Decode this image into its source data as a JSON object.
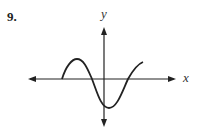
{
  "problem": {
    "number": "9."
  },
  "axes": {
    "x_label": "x",
    "y_label": "y"
  },
  "curve": {
    "description": "sinusoidal curve",
    "points": [
      [
        62,
        79
      ],
      [
        77,
        59
      ],
      [
        92,
        79
      ],
      [
        108,
        108
      ],
      [
        128,
        79
      ],
      [
        143,
        62
      ]
    ]
  }
}
